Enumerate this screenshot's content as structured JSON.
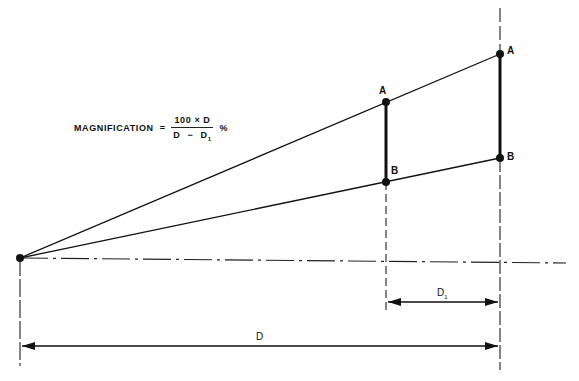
{
  "diagram": {
    "formula": {
      "lhs": "MAGNIFICATION",
      "equals": "=",
      "numerator": "100 × D",
      "denominator_a": "D",
      "denominator_op": "−",
      "denominator_b": "D",
      "denominator_b_sub": "1",
      "unit": "%"
    },
    "labels": {
      "inner_top": "A",
      "inner_bottom": "B",
      "outer_top": "A",
      "outer_bottom": "B",
      "d1": "D",
      "d1_sub": "1",
      "d": "D"
    },
    "colors": {
      "line": "#111111",
      "background": "#ffffff"
    }
  }
}
